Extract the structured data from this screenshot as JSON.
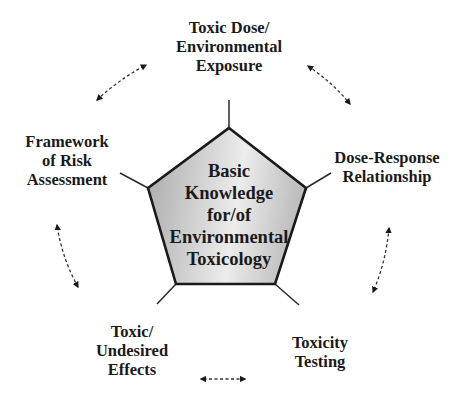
{
  "center": {
    "lines": [
      "Basic",
      "Knowledge",
      "for/of",
      "Environmental",
      "Toxicology"
    ]
  },
  "nodes": [
    {
      "id": "top",
      "lines": [
        "Toxic Dose/",
        "Environmental",
        "Exposure"
      ]
    },
    {
      "id": "right",
      "lines": [
        "Dose-Response",
        "Relationship"
      ]
    },
    {
      "id": "bottom-right",
      "lines": [
        "Toxicity",
        "Testing"
      ]
    },
    {
      "id": "bottom-left",
      "lines": [
        "Toxic/",
        "Undesired",
        "Effects"
      ]
    },
    {
      "id": "left",
      "lines": [
        "Framework",
        "of Risk",
        "Assessment"
      ]
    }
  ],
  "connections": [
    {
      "from": "top",
      "to": "right",
      "style": "dashed",
      "arrows": "both"
    },
    {
      "from": "right",
      "to": "bottom-right",
      "style": "dashed",
      "arrows": "both"
    },
    {
      "from": "bottom-right",
      "to": "bottom-left",
      "style": "dashed",
      "arrows": "both"
    },
    {
      "from": "bottom-left",
      "to": "left",
      "style": "dashed",
      "arrows": "both"
    },
    {
      "from": "left",
      "to": "top",
      "style": "dashed",
      "arrows": "both"
    }
  ],
  "colors": {
    "pentagon_fill_dark": "#a9a9a9",
    "pentagon_fill_light": "#ececec",
    "stroke": "#1a1a1a",
    "text": "#1a1a1a",
    "background": "#ffffff"
  }
}
